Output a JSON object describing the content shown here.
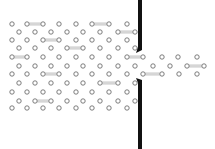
{
  "diagram": {
    "caption": "",
    "colors": {
      "background": "#ffffff",
      "molecule_stroke": "#6e6e6e",
      "bond": "#a8a8a8",
      "wall": "#111111"
    },
    "molecule_radius": 2.2,
    "wall": {
      "x": 138,
      "width": 4,
      "upper_segment": {
        "y_top": 0,
        "y_bottom": 50,
        "tip": [
          136,
          53
        ]
      },
      "lower_segment": {
        "y_top": 80,
        "y_bottom": 149,
        "tip": [
          136,
          78
        ]
      },
      "opening": {
        "y_from": 53,
        "y_to": 78
      }
    },
    "left_region": {
      "rows_y": [
        24,
        32,
        40,
        48,
        57,
        66,
        74,
        83,
        92,
        101,
        108
      ],
      "even_row_x": [
        12,
        27,
        43,
        59,
        76,
        92,
        109,
        127
      ],
      "odd_row_x": [
        19,
        35,
        51,
        67,
        83,
        100,
        118,
        135
      ]
    },
    "right_region": {
      "molecules": [
        [
          143,
          57
        ],
        [
          162,
          57
        ],
        [
          178,
          57
        ],
        [
          197,
          57
        ],
        [
          153,
          66
        ],
        [
          170,
          66
        ],
        [
          187,
          66
        ],
        [
          204,
          66
        ],
        [
          143,
          74
        ],
        [
          162,
          74
        ],
        [
          179,
          74
        ],
        [
          197,
          74
        ]
      ]
    },
    "bonds": [
      [
        [
          27,
          24
        ],
        [
          43,
          24
        ]
      ],
      [
        [
          92,
          24
        ],
        [
          109,
          24
        ]
      ],
      [
        [
          118,
          32
        ],
        [
          135,
          32
        ]
      ],
      [
        [
          43,
          40
        ],
        [
          59,
          40
        ]
      ],
      [
        [
          67,
          48
        ],
        [
          83,
          48
        ]
      ],
      [
        [
          12,
          57
        ],
        [
          27,
          57
        ]
      ],
      [
        [
          127,
          57
        ],
        [
          143,
          57
        ]
      ],
      [
        [
          187,
          66
        ],
        [
          204,
          66
        ]
      ],
      [
        [
          43,
          74
        ],
        [
          59,
          74
        ]
      ],
      [
        [
          143,
          74
        ],
        [
          162,
          74
        ]
      ],
      [
        [
          100,
          83
        ],
        [
          118,
          83
        ]
      ],
      [
        [
          35,
          101
        ],
        [
          51,
          101
        ]
      ]
    ]
  }
}
